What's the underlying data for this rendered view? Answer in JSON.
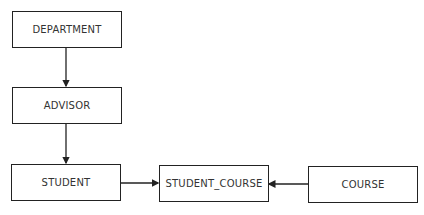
{
  "diagram": {
    "type": "entity-relationship",
    "nodes": [
      {
        "id": "department",
        "label": "DEPARTMENT"
      },
      {
        "id": "advisor",
        "label": "ADVISOR"
      },
      {
        "id": "student",
        "label": "STUDENT"
      },
      {
        "id": "student_course",
        "label": "STUDENT_COURSE"
      },
      {
        "id": "course",
        "label": "COURSE"
      }
    ],
    "edges": [
      {
        "from": "department",
        "to": "advisor"
      },
      {
        "from": "advisor",
        "to": "student"
      },
      {
        "from": "student",
        "to": "student_course"
      },
      {
        "from": "course",
        "to": "student_course"
      }
    ],
    "colors": {
      "stroke": "#222222",
      "text": "#333333",
      "background": "#ffffff"
    }
  }
}
